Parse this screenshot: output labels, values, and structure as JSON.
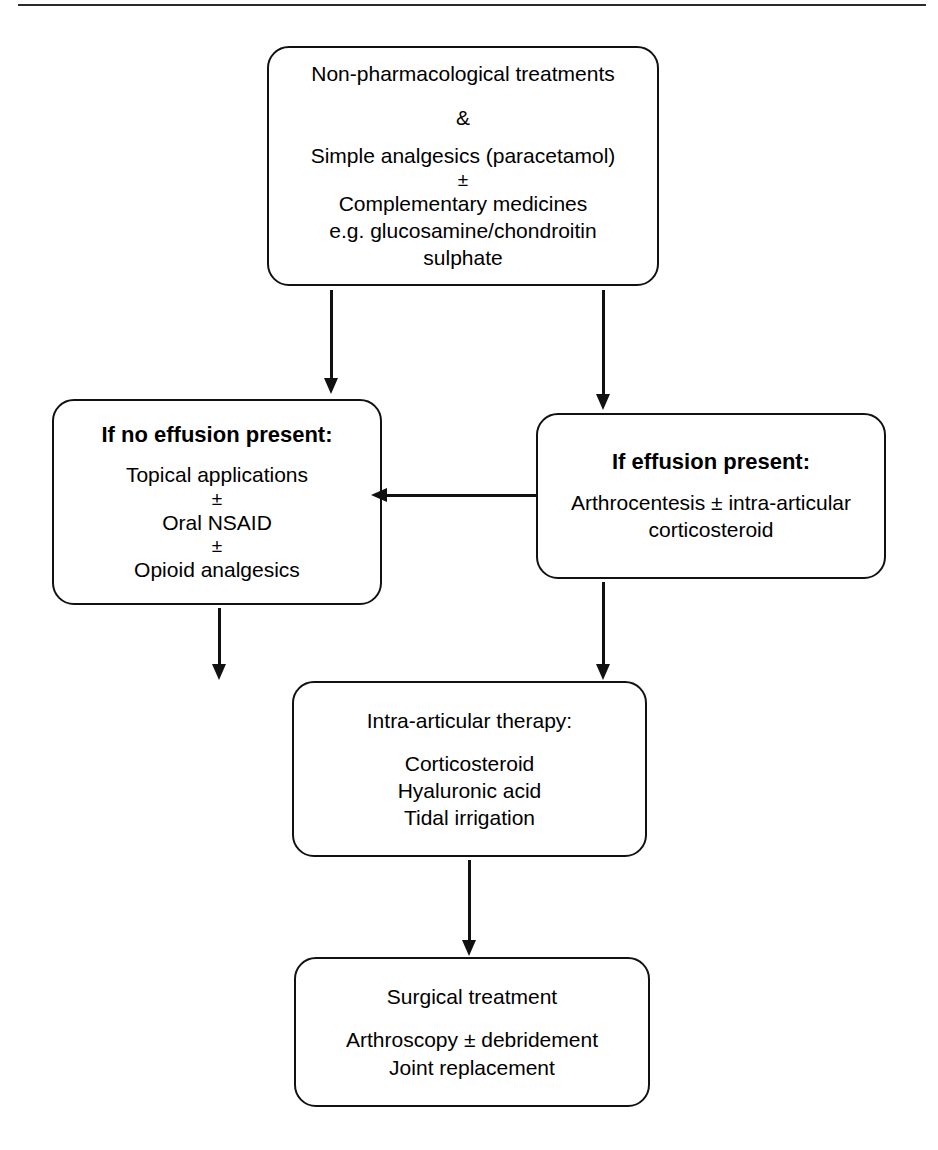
{
  "diagram": {
    "top_rule": true,
    "accent_color": "#111111",
    "background_color": "#ffffff"
  },
  "nodes": {
    "initial_management": {
      "lines": [
        "Non-pharmacological treatments",
        "&",
        "Simple analgesics (paracetamol)",
        "±",
        "Complementary medicines",
        "e.g. glucosamine/chondroitin",
        "sulphate"
      ]
    },
    "no_effusion": {
      "heading": "If no effusion present:",
      "lines": [
        "Topical applications",
        "±",
        "Oral NSAID",
        "±",
        "Opioid analgesics"
      ]
    },
    "effusion": {
      "heading": "If effusion present:",
      "lines": [
        "Arthrocentesis ± intra-articular",
        "corticosteroid"
      ]
    },
    "intra_articular": {
      "heading": "Intra-articular therapy:",
      "lines": [
        "Corticosteroid",
        "Hyaluronic acid",
        "Tidal irrigation"
      ]
    },
    "surgical": {
      "heading": "Surgical treatment",
      "lines": [
        "Arthroscopy ± debridement",
        "Joint replacement"
      ]
    }
  },
  "arrows": [
    {
      "id": "initial-to-no-effusion",
      "direction": "down"
    },
    {
      "id": "initial-to-effusion",
      "direction": "down"
    },
    {
      "id": "effusion-to-no-effusion",
      "direction": "left"
    },
    {
      "id": "no-effusion-to-intra-articular",
      "direction": "down"
    },
    {
      "id": "effusion-to-intra-articular",
      "direction": "down"
    },
    {
      "id": "intra-articular-to-surgical",
      "direction": "down"
    }
  ]
}
